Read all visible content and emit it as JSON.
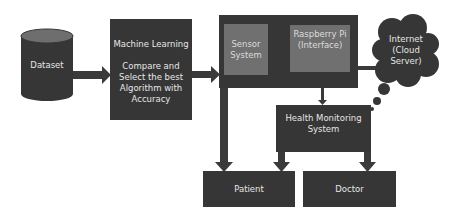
{
  "diagram": {
    "nodes": {
      "dataset": {
        "label": "Dataset",
        "shape": "cylinder"
      },
      "ml": {
        "title": "Machine Learning",
        "body": "Compare and\nSelect the best\nAlgorithm with\nAccuracy"
      },
      "sensor": {
        "label": "Sensor\nSystem"
      },
      "raspberry": {
        "label": "Raspberry Pi\n(Interface)"
      },
      "internet": {
        "label": "Internet\n(Cloud\nServer)",
        "shape": "cloud"
      },
      "health": {
        "label": "Health Monitoring\nSystem"
      },
      "patient": {
        "label": "Patient"
      },
      "doctor": {
        "label": "Doctor"
      }
    },
    "edges": [
      {
        "from": "dataset",
        "to": "ml"
      },
      {
        "from": "ml",
        "to": "iot-block"
      },
      {
        "from": "sensor",
        "to": "raspberry"
      },
      {
        "from": "iot-block",
        "to": "internet"
      },
      {
        "from": "iot-block",
        "to": "health"
      },
      {
        "from": "iot-block",
        "to": "patient"
      },
      {
        "from": "health",
        "to": "patient"
      },
      {
        "from": "health",
        "to": "doctor"
      }
    ],
    "colors": {
      "dark": "#363636",
      "inner": "#707070",
      "arrow_light": "#9c9c9c",
      "text": "#e6e6e6"
    }
  }
}
